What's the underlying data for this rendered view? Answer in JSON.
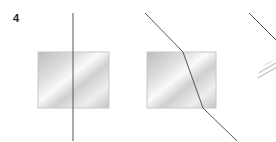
{
  "figure": {
    "label": "4",
    "colors": {
      "line": "#555555",
      "block_border": "#c8c8c8",
      "block_light": "#fafafa",
      "block_dark": "#b4b4b4",
      "hatch": "#888888"
    },
    "panels": [
      {
        "id": "panel-1",
        "block": {
          "x": 38,
          "y": 52,
          "w": 71,
          "h": 56
        },
        "ray": [
          [
            73,
            13
          ],
          [
            73,
            141
          ]
        ]
      },
      {
        "id": "panel-2",
        "block": {
          "x": 147,
          "y": 52,
          "w": 69,
          "h": 56
        },
        "ray": [
          [
            145,
            13
          ],
          [
            183,
            52
          ],
          [
            203,
            108
          ],
          [
            237,
            141
          ]
        ]
      },
      {
        "id": "panel-3",
        "ray": [
          [
            249,
            13
          ],
          [
            276,
            40
          ]
        ],
        "hatched_region": {
          "x": 257,
          "y": 60,
          "w": 19,
          "h": 18
        }
      }
    ]
  }
}
